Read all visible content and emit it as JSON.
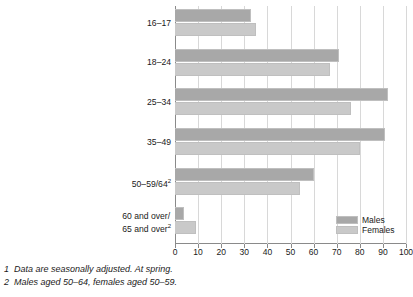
{
  "chart_data": {
    "type": "bar",
    "orientation": "horizontal",
    "title": "",
    "subtitle": "",
    "xlabel": "",
    "ylabel": "",
    "xlim": [
      0,
      100
    ],
    "xticks": [
      0,
      10,
      20,
      30,
      40,
      50,
      60,
      70,
      80,
      90,
      100
    ],
    "xtick_labels": [
      "0",
      "10",
      "20",
      "30",
      "40",
      "50",
      "60",
      "70",
      "80",
      "90",
      "100"
    ],
    "grid": true,
    "legend_position": "bottom-right",
    "categories": [
      "16–17",
      "18–24",
      "25–34",
      "35–49",
      "50–59/64",
      "60 and over/ 65 and over"
    ],
    "category_labels": [
      {
        "lines": [
          "16–17"
        ],
        "superscript": ""
      },
      {
        "lines": [
          "18–24"
        ],
        "superscript": ""
      },
      {
        "lines": [
          "25–34"
        ],
        "superscript": ""
      },
      {
        "lines": [
          "35–49"
        ],
        "superscript": ""
      },
      {
        "lines": [
          "50–59/64"
        ],
        "superscript": "2"
      },
      {
        "lines": [
          "60 and over/",
          "65 and over"
        ],
        "superscript": "2"
      }
    ],
    "series": [
      {
        "name": "Males",
        "color": "#a8a8a8",
        "values": [
          33,
          71,
          92,
          91,
          60,
          4
        ]
      },
      {
        "name": "Females",
        "color": "#c9c9c9",
        "values": [
          35,
          67,
          76,
          80,
          54,
          9
        ]
      }
    ],
    "legend": [
      "Males",
      "Females"
    ],
    "annotations": [
      "1  Data are seasonally adjusted. At spring.",
      "2  Males aged 50–64, females aged 50–59."
    ]
  },
  "footnotes": [
    {
      "num": "1",
      "text": "Data are seasonally adjusted. At spring."
    },
    {
      "num": "2",
      "text": "Males aged 50–64, females aged 50–59."
    }
  ],
  "legend": {
    "males_label": "Males",
    "females_label": "Females"
  },
  "colors": {
    "males": "#a8a8a8",
    "females": "#c9c9c9",
    "grid": "#d8d8d8",
    "axis": "#8a8a8a",
    "text": "#1a1a1a"
  }
}
